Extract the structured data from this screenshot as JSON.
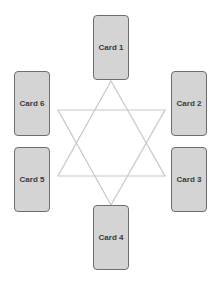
{
  "diagram": {
    "type": "six-card spread around hexagram",
    "line_color": "#c8c8c8",
    "card_fill": "#d4d4d4",
    "card_border": "#6e6e6e",
    "cards": [
      {
        "label": "Card 1",
        "position": "top"
      },
      {
        "label": "Card 2",
        "position": "upper-right"
      },
      {
        "label": "Card 3",
        "position": "lower-right"
      },
      {
        "label": "Card 4",
        "position": "bottom"
      },
      {
        "label": "Card 5",
        "position": "lower-left"
      },
      {
        "label": "Card 6",
        "position": "upper-left"
      }
    ]
  }
}
